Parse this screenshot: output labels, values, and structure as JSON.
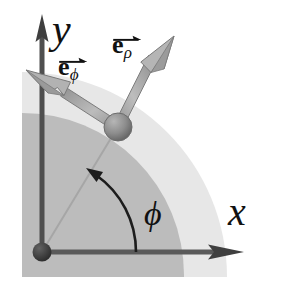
{
  "figure": {
    "type": "vector-diagram",
    "background_color": "#ffffff"
  },
  "regions": {
    "inner_disc": {
      "name": "shaded-quarter-disc-inner",
      "color": "#bcbcbc",
      "description": "darker gray quarter region with rounded top-right corner"
    },
    "outer_disc": {
      "name": "shaded-quarter-disc-outer",
      "color": "#e4e4e4",
      "description": "lighter gray quarter annulus beyond the inner disc"
    }
  },
  "geometry": {
    "origin": {
      "x": 42,
      "y": 252
    },
    "point": {
      "x": 118,
      "y": 127
    },
    "y_axis_tip": {
      "x": 42,
      "y": 16
    },
    "x_axis_tip": {
      "x": 242,
      "y": 252
    },
    "e_rho_tip": {
      "x": 174,
      "y": 36
    },
    "e_phi_tip": {
      "x": 26,
      "y": 70
    },
    "phi_angle_degrees": 58,
    "inner_radius": 160,
    "outer_radius": 205
  },
  "labels": {
    "y_axis": "y",
    "x_axis": "x",
    "e_symbol": "e",
    "e_phi_subscript": "ϕ",
    "e_rho_subscript": "ρ",
    "phi_angle": "ϕ"
  },
  "colors": {
    "axis": "#4a4a4a",
    "vector_body": "#9a9a9a",
    "vector_edge": "#6e6e6e",
    "sphere": "#8a8a8a",
    "origin_dot": "#3c3c3c",
    "radial_line": "#a8a8a8",
    "text": "#111111",
    "arc": "#1d1d1d"
  }
}
